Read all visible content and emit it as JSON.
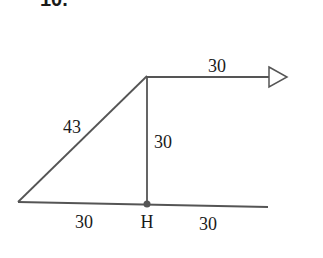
{
  "problem": {
    "number_label": "10."
  },
  "colors": {
    "stroke": "#555555",
    "text": "#1a1a1a",
    "point": "#555555",
    "background": "#ffffff"
  },
  "diagram": {
    "points": {
      "left_vertex": {
        "x": 18,
        "y": 202
      },
      "apex": {
        "x": 147,
        "y": 76
      },
      "H": {
        "x": 147,
        "y": 204
      },
      "base_right_end": {
        "x": 268,
        "y": 207
      },
      "arrow_tip": {
        "x": 287,
        "y": 77
      }
    },
    "labels": {
      "hypotenuse": "43",
      "vertical": "30",
      "arrow_top": "30",
      "base_left": "30",
      "base_right": "30",
      "point_H": "H"
    },
    "arrow_icon": "hollow-triangle-arrowhead"
  }
}
